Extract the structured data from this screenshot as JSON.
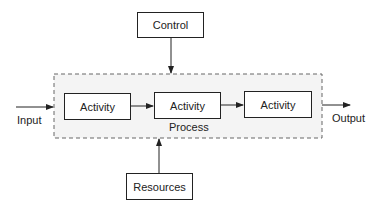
{
  "diagram": {
    "control": {
      "label": "Control"
    },
    "resources": {
      "label": "Resources"
    },
    "process": {
      "label": "Process"
    },
    "activities": [
      {
        "label": "Activity"
      },
      {
        "label": "Activity"
      },
      {
        "label": "Activity"
      }
    ],
    "input": {
      "label": "Input"
    },
    "output": {
      "label": "Output"
    },
    "colors": {
      "line": "#222222",
      "process_fill": "#f4f4f4",
      "dash": "#666666"
    }
  }
}
